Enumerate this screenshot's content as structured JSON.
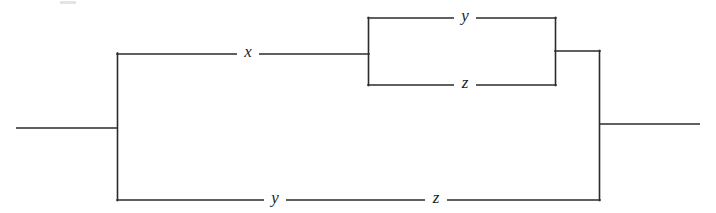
{
  "figure": {
    "kind": "switching-circuit-diagram",
    "background_color": "#ffffff",
    "line_color": "#2b2b2b",
    "label_color": "#1d1d1d",
    "width": 716,
    "height": 213
  },
  "terminals": {
    "left": {
      "name": "left-terminal-wire",
      "x1": 16,
      "y1": 128,
      "x2": 118,
      "y2": 128
    },
    "right": {
      "name": "right-terminal-wire",
      "x1": 599,
      "y1": 124,
      "x2": 700,
      "y2": 124
    }
  },
  "rails": {
    "left_vertical": {
      "x": 117,
      "y1": 53,
      "y2": 200
    },
    "right_vertical": {
      "x": 599,
      "y1": 51,
      "y2": 200
    }
  },
  "branches": {
    "upper": {
      "name": "upper-branch",
      "wire": {
        "x1": 117,
        "y1": 54,
        "x2": 368,
        "y2": 54
      },
      "label": "x",
      "label_x": 248,
      "label_y": 53
    },
    "lower": {
      "name": "lower-branch",
      "wire": {
        "x1": 117,
        "y1": 200,
        "x2": 599,
        "y2": 200
      },
      "labels": [
        {
          "text": "y",
          "x": 275,
          "y": 199
        },
        {
          "text": "z",
          "x": 436,
          "y": 199
        }
      ]
    }
  },
  "parallel_block": {
    "name": "inner-parallel-block",
    "left_vertical": {
      "x": 368,
      "y1": 18,
      "y2": 85
    },
    "right_vertical": {
      "x": 555,
      "y1": 18,
      "y2": 82
    },
    "junction_wire": {
      "x1": 555,
      "y1": 51,
      "x2": 600,
      "y2": 51
    },
    "top_rail": {
      "name": "inner-top-rail",
      "y": 18,
      "x1": 368,
      "x2": 555,
      "label": "y",
      "label_x": 465,
      "label_y": 17
    },
    "bottom_rail": {
      "name": "inner-bottom-rail",
      "y": 85,
      "x1": 368,
      "x2": 555,
      "label": "z",
      "label_x": 465,
      "label_y": 84
    }
  },
  "labels": {
    "x_switch": "x",
    "y_switch_top": "y",
    "z_switch_bottom": "z",
    "y_switch_lower": "y",
    "z_switch_lower": "z"
  }
}
